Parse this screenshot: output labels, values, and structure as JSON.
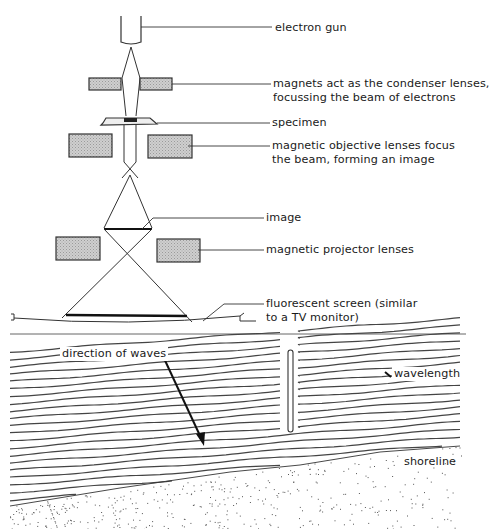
{
  "figure_top": {
    "title": "Transmission electron microscope",
    "labels": {
      "electron_gun": "electron gun",
      "condenser_line1": "magnets act as the condenser lenses,",
      "condenser_line2": "focussing the beam of electrons",
      "specimen": "specimen",
      "objective_line1": "magnetic objective lenses focus",
      "objective_line2": "the beam, forming an image",
      "image": "image",
      "projector": "magnetic projector lenses",
      "screen_line1": "fluorescent screen (similar",
      "screen_line2": "to a TV monitor)"
    },
    "colors": {
      "lens_fill": "#c8c8c8",
      "stroke": "#333333"
    }
  },
  "figure_bottom": {
    "title": "Waves approaching a shoreline past a barrier",
    "labels": {
      "direction": "direction of waves",
      "wavelength": "wavelength",
      "shoreline": "shoreline"
    },
    "colors": {
      "wave_stroke": "#444444",
      "sand_dots": "#555555"
    }
  }
}
